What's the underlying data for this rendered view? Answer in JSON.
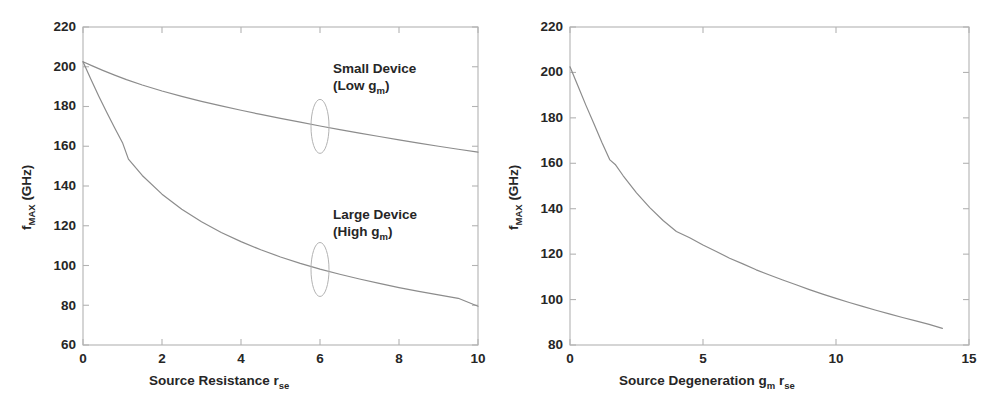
{
  "figure": {
    "background": "#ffffff",
    "line_color": "#8c8c8c",
    "axis_color": "#b3b3b3",
    "text_color": "#262626"
  },
  "chart_data": [
    {
      "id": "left",
      "type": "line",
      "title": "",
      "xlabel": "Source Resistance r",
      "xlabel_sub": "se",
      "ylabel": "f",
      "ylabel_sub": "MAX",
      "ylabel_unit": " (GHz)",
      "xlim": [
        0,
        10
      ],
      "ylim": [
        60,
        220
      ],
      "xticks": [
        0,
        2,
        4,
        6,
        8,
        10
      ],
      "yticks": [
        60,
        80,
        100,
        120,
        140,
        160,
        180,
        200,
        220
      ],
      "grid": false,
      "legend_position": "inline-annotations",
      "series": [
        {
          "name": "Small Device (Low gm)",
          "x": [
            0,
            0.25,
            0.5,
            0.8,
            1.1,
            1.5,
            2.0,
            2.5,
            3.0,
            3.5,
            4.0,
            4.5,
            5.0,
            5.5,
            6.0,
            6.5,
            7.0,
            7.5,
            8.0,
            8.5,
            9.0,
            9.5,
            10.0
          ],
          "values": [
            202.5,
            200.3,
            198.2,
            195.8,
            193.5,
            190.8,
            187.8,
            185.1,
            182.6,
            180.3,
            178.1,
            176.0,
            174.0,
            172.1,
            170.2,
            168.4,
            166.6,
            164.9,
            163.2,
            161.6,
            160.0,
            158.5,
            157.0
          ]
        },
        {
          "name": "Large Device (High gm)",
          "x": [
            0,
            0.2,
            0.4,
            0.6,
            0.8,
            1.0,
            1.15,
            1.5,
            2.0,
            2.5,
            3.0,
            3.5,
            4.0,
            4.5,
            5.0,
            5.5,
            6.0,
            6.5,
            7.0,
            7.5,
            8.0,
            8.5,
            9.0,
            9.5,
            10.0
          ],
          "values": [
            202.5,
            193.7,
            185.2,
            177.1,
            169.3,
            161.8,
            153.5,
            145.3,
            135.9,
            128.3,
            122.0,
            116.6,
            112.0,
            107.9,
            104.3,
            101.1,
            98.2,
            95.6,
            93.2,
            91.0,
            88.9,
            87.0,
            85.2,
            83.5,
            79.5
          ]
        }
      ],
      "annotations": [
        {
          "id": "small-device",
          "line1": "Small Device",
          "line2_pre": "(Low g",
          "line2_sub": "m",
          "line2_post": ")",
          "marker": "ellipse",
          "marker_x": 6.0,
          "marker_y": 170
        },
        {
          "id": "large-device",
          "line1": "Large Device",
          "line2_pre": "(High g",
          "line2_sub": "m",
          "line2_post": ")",
          "marker": "ellipse",
          "marker_x": 6.0,
          "marker_y": 98
        }
      ]
    },
    {
      "id": "right",
      "type": "line",
      "title": "",
      "xlabel": "Source Degeneration g",
      "xlabel_sub1": "m",
      "xlabel_mid": " r",
      "xlabel_sub2": "se",
      "ylabel": "f",
      "ylabel_sub": "MAX",
      "ylabel_unit": " (GHz)",
      "xlim": [
        0,
        15
      ],
      "ylim": [
        80,
        220
      ],
      "xticks": [
        0,
        5,
        10,
        15
      ],
      "yticks": [
        80,
        100,
        120,
        140,
        160,
        180,
        200,
        220
      ],
      "grid": false,
      "legend_position": "none",
      "series": [
        {
          "name": "fMAX vs source degeneration",
          "x": [
            0,
            0.3,
            0.6,
            0.9,
            1.2,
            1.5,
            1.7,
            2.0,
            2.5,
            3.0,
            3.5,
            4.0,
            4.5,
            5.0,
            5.5,
            6.0,
            6.5,
            7.0,
            7.5,
            8.0,
            8.5,
            9.0,
            9.5,
            10.0,
            10.5,
            11.0,
            11.5,
            12.0,
            12.5,
            13.0,
            13.5,
            14.0
          ],
          "values": [
            202.5,
            194.0,
            185.5,
            177.4,
            169.2,
            161.5,
            159.5,
            154.5,
            147.0,
            140.5,
            134.8,
            130.0,
            127.2,
            124.0,
            121.2,
            118.2,
            115.7,
            113.1,
            110.8,
            108.6,
            106.5,
            104.4,
            102.4,
            100.5,
            98.7,
            97.0,
            95.3,
            93.7,
            92.1,
            90.6,
            89.1,
            87.3
          ]
        }
      ],
      "annotations": []
    }
  ]
}
